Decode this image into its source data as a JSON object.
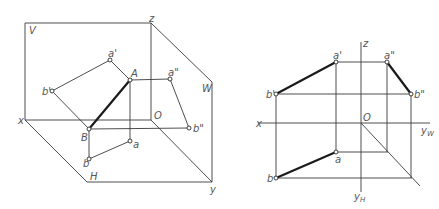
{
  "left_diagram": {
    "name": "pictorial three-plane projection",
    "planes": {
      "V": "V",
      "H": "H",
      "W": "W"
    },
    "axes": {
      "x": "x",
      "y": "y",
      "z": "z",
      "origin": "O"
    },
    "points": {
      "A": "A",
      "B": "B",
      "a_front": "a'",
      "b_front": "b'",
      "a_top": "a",
      "b_top": "b",
      "a_side": "a\"",
      "b_side": "b\""
    }
  },
  "right_diagram": {
    "name": "orthographic projection layout",
    "axes": {
      "x": "x",
      "z": "z",
      "origin": "O",
      "yw": "y",
      "yw_sub": "W",
      "yh": "y",
      "yh_sub": "H"
    },
    "points": {
      "a_front": "a'",
      "b_front": "b'",
      "a_top": "a",
      "b_top": "b",
      "a_side": "a\"",
      "b_side": "b\""
    }
  }
}
